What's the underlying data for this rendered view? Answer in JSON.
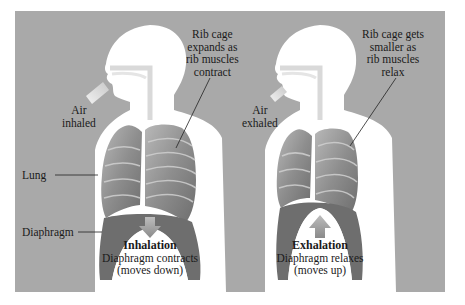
{
  "figure": {
    "background_color": "#a9a9a9",
    "panels": [
      {
        "phase": "Inhalation",
        "air_label_line1": "Air",
        "air_label_line2": "inhaled",
        "rib_label_line1": "Rib cage",
        "rib_label_line2": "expands as",
        "rib_label_line3": "rib muscles",
        "rib_label_line4": "contract",
        "caption_title": "Inhalation",
        "caption_line1": "Diaphragm contracts",
        "caption_line2": "(moves down)",
        "arrow_direction": "down"
      },
      {
        "phase": "Exhalation",
        "air_label_line1": "Air",
        "air_label_line2": "exhaled",
        "rib_label_line1": "Rib cage gets",
        "rib_label_line2": "smaller as",
        "rib_label_line3": "rib muscles",
        "rib_label_line4": "relax",
        "caption_title": "Exhalation",
        "caption_line1": "Diaphragm relaxes",
        "caption_line2": "(moves up)",
        "arrow_direction": "up"
      }
    ],
    "side_labels": {
      "lung": "Lung",
      "diaphragm": "Diaphragm"
    }
  }
}
